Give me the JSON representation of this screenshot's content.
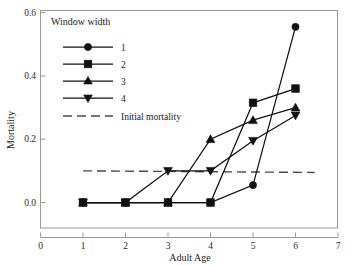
{
  "chart_data": {
    "type": "line",
    "title": "",
    "xlabel": "Adult Age",
    "ylabel": "Mortality",
    "xlim": [
      0,
      7
    ],
    "ylim": [
      0.0,
      0.6
    ],
    "xticks": [
      "0",
      "1",
      "2",
      "3",
      "4",
      "5",
      "6",
      "7"
    ],
    "xtick_values": [
      0,
      1,
      2,
      3,
      4,
      5,
      6,
      7
    ],
    "yticks": [
      "0.0",
      "0.2",
      "0.4",
      "0.6"
    ],
    "ytick_values": [
      0.0,
      0.2,
      0.4,
      0.6
    ],
    "grid": false,
    "legend_position": "upper-left-inside",
    "legend_title": "Window width",
    "x": [
      1,
      2,
      3,
      4,
      5,
      6
    ],
    "series": [
      {
        "name": "1",
        "marker": "circle",
        "values": [
          0.0,
          0.0,
          0.0,
          0.0,
          0.055,
          0.555
        ]
      },
      {
        "name": "2",
        "marker": "square",
        "values": [
          0.0,
          0.0,
          0.0,
          0.0,
          0.315,
          0.36
        ]
      },
      {
        "name": "3",
        "marker": "triangle-up",
        "values": [
          0.0,
          0.0,
          0.0,
          0.2,
          0.26,
          0.3
        ]
      },
      {
        "name": "4",
        "marker": "triangle-down",
        "values": [
          0.0,
          0.0,
          0.1,
          0.1,
          0.195,
          0.275
        ]
      }
    ],
    "reference_line": {
      "name": "Initial mortality",
      "style": "dashed",
      "y_start": 0.1,
      "y_end": 0.095,
      "x_start": 1.0,
      "x_end": 6.45
    },
    "colors": {
      "series": "#111111",
      "reference": "#4a4a4a",
      "frame": "#9a9a9a",
      "background": "#ffffff"
    }
  },
  "legend": {
    "title": "Window width",
    "entries": [
      {
        "label": "1",
        "marker": "circle-marker-icon"
      },
      {
        "label": "2",
        "marker": "square-marker-icon"
      },
      {
        "label": "3",
        "marker": "triangle-up-marker-icon"
      },
      {
        "label": "4",
        "marker": "triangle-down-marker-icon"
      }
    ],
    "reference_label": "Initial mortality"
  },
  "axes": {
    "x_title": "Adult Age",
    "y_title": "Mortality",
    "x_tick_labels": [
      "0",
      "1",
      "2",
      "3",
      "4",
      "5",
      "6",
      "7"
    ],
    "y_tick_labels": [
      "0.0",
      "0.2",
      "0.4",
      "0.6"
    ]
  }
}
